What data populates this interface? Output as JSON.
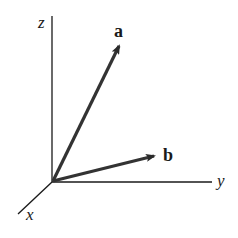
{
  "diagram": {
    "axes": [
      {
        "name": "z",
        "label": "z"
      },
      {
        "name": "y",
        "label": "y"
      },
      {
        "name": "x",
        "label": "x"
      }
    ],
    "vectors": [
      {
        "name": "a",
        "label": "a"
      },
      {
        "name": "b",
        "label": "b"
      }
    ],
    "colors": {
      "line": "#1a1a1a",
      "vector": "#333333",
      "background": "#ffffff"
    }
  }
}
